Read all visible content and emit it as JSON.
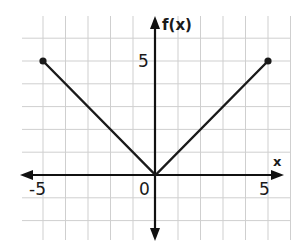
{
  "chart_data": {
    "type": "line",
    "title": "",
    "function": "f(x) = |x|",
    "xlabel": "x",
    "ylabel": "f(x)",
    "series": [
      {
        "name": "f(x)",
        "points": [
          [
            -5,
            5
          ],
          [
            0,
            0
          ],
          [
            5,
            5
          ]
        ],
        "endpoints": "closed"
      }
    ],
    "x_ticks_labeled": [
      {
        "value": -5,
        "label": "-5"
      },
      {
        "value": 0,
        "label": "0"
      },
      {
        "value": 5,
        "label": "5"
      }
    ],
    "y_ticks_labeled": [
      {
        "value": 5,
        "label": "5"
      }
    ],
    "xlim": [
      -6,
      6
    ],
    "ylim": [
      -2.6,
      7
    ],
    "grid": true,
    "grid_step": 1,
    "legend": "none"
  },
  "labels": {
    "x_axis": "x",
    "y_axis": "f(x)",
    "x_neg5": "-5",
    "x_origin": "0",
    "x_pos5": "5",
    "y_pos5": "5"
  },
  "colors": {
    "line": "#1a1a1a",
    "grid": "#cfcfcf",
    "axis": "#111111"
  }
}
